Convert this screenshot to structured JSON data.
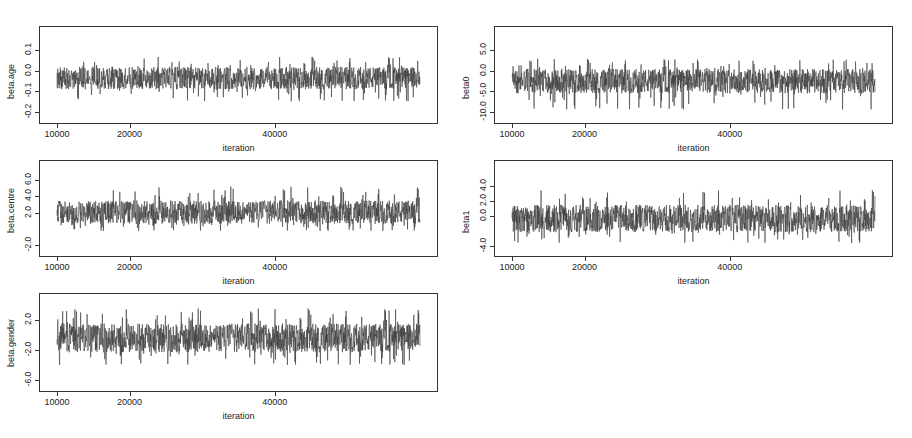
{
  "chart_data": [
    {
      "type": "line",
      "title": "",
      "xlabel": "iteration",
      "ylabel": "beta.age",
      "x_ticks": [
        10000,
        20000,
        40000
      ],
      "x_range": [
        10000,
        60000
      ],
      "y_ticks": [
        0.1,
        0.0,
        -0.1,
        -0.2
      ],
      "y_tick_labels": [
        "0.1",
        "0.0",
        "-0.1",
        "-0.2"
      ],
      "ylim": [
        -0.24,
        0.2
      ],
      "series": [
        {
          "name": "beta.age",
          "mean": -0.04,
          "band_low": -0.09,
          "band_high": 0.02,
          "min": -0.15,
          "max": 0.07
        }
      ],
      "grid": false
    },
    {
      "type": "line",
      "title": "",
      "xlabel": "iteration",
      "ylabel": "beta0",
      "x_ticks": [
        10000,
        20000,
        40000
      ],
      "x_range": [
        10000,
        60000
      ],
      "y_ticks": [
        5.0,
        0.0,
        -5.0,
        -10.0
      ],
      "y_tick_labels": [
        "5.0",
        "0.0",
        "-5.0",
        "-10.0"
      ],
      "ylim": [
        -12,
        10
      ],
      "series": [
        {
          "name": "beta0",
          "mean": -2.5,
          "band_low": -5.5,
          "band_high": 0.5,
          "min": -9.5,
          "max": 3.0
        }
      ],
      "grid": false
    },
    {
      "type": "line",
      "title": "",
      "xlabel": "iteration",
      "ylabel": "beta.centre",
      "x_ticks": [
        10000,
        20000,
        40000
      ],
      "x_range": [
        10000,
        60000
      ],
      "y_ticks": [
        6.0,
        4.0,
        2.0,
        -2.0
      ],
      "y_tick_labels": [
        "6.0",
        "4.0",
        "2.0",
        "-2.0"
      ],
      "ylim": [
        -3,
        8
      ],
      "series": [
        {
          "name": "beta.centre",
          "mean": 2.2,
          "band_low": 0.6,
          "band_high": 3.5,
          "min": -0.3,
          "max": 5.2
        }
      ],
      "grid": false
    },
    {
      "type": "line",
      "title": "",
      "xlabel": "iteration",
      "ylabel": "beta1",
      "x_ticks": [
        10000,
        20000,
        40000
      ],
      "x_range": [
        10000,
        60000
      ],
      "y_ticks": [
        4.0,
        2.0,
        0.0,
        -4.0
      ],
      "y_tick_labels": [
        "4.0",
        "2.0",
        "0.0",
        "-4.0"
      ],
      "ylim": [
        -5,
        7
      ],
      "series": [
        {
          "name": "beta1",
          "mean": -0.2,
          "band_low": -2.2,
          "band_high": 1.5,
          "min": -3.7,
          "max": 3.5
        }
      ],
      "grid": false
    },
    {
      "type": "line",
      "title": "",
      "xlabel": "iteration",
      "ylabel": "beta.gender",
      "x_ticks": [
        10000,
        20000,
        40000
      ],
      "x_range": [
        10000,
        60000
      ],
      "y_ticks": [
        2.0,
        -2.0,
        -6.0
      ],
      "y_tick_labels": [
        "2.0",
        "-2.0",
        "-6.0"
      ],
      "ylim": [
        -7,
        5
      ],
      "series": [
        {
          "name": "beta.gender",
          "mean": -0.3,
          "band_low": -2.3,
          "band_high": 1.5,
          "min": -4.0,
          "max": 3.5
        }
      ],
      "grid": false
    }
  ],
  "panels": [
    {
      "ylabel": "beta.age",
      "xlabel": "iteration",
      "xticks": [
        "10000",
        "20000",
        "40000"
      ],
      "yticks": [
        "0.1",
        "0.0",
        "-0.1",
        "-0.2"
      ]
    },
    {
      "ylabel": "beta0",
      "xlabel": "iteration",
      "xticks": [
        "10000",
        "20000",
        "40000"
      ],
      "yticks": [
        "5.0",
        "0.0",
        "-5.0",
        "-10.0"
      ]
    },
    {
      "ylabel": "beta.centre",
      "xlabel": "iteration",
      "xticks": [
        "10000",
        "20000",
        "40000"
      ],
      "yticks": [
        "6.0",
        "4.0",
        "2.0",
        "-2.0"
      ]
    },
    {
      "ylabel": "beta1",
      "xlabel": "iteration",
      "xticks": [
        "10000",
        "20000",
        "40000"
      ],
      "yticks": [
        "4.0",
        "2.0",
        "0.0",
        "-4.0"
      ]
    },
    {
      "ylabel": "beta.gender",
      "xlabel": "iteration",
      "xticks": [
        "10000",
        "20000",
        "40000"
      ],
      "yticks": [
        "2.0",
        "-2.0",
        "-6.0"
      ]
    }
  ],
  "colors": {
    "trace": "#3a3a3a",
    "frame": "#333333",
    "background": "#ffffff"
  }
}
